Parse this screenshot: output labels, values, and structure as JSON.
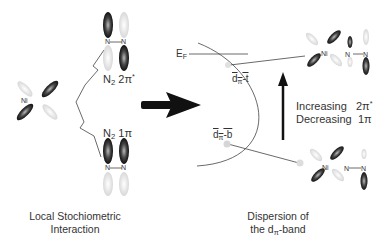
{
  "diagram": {
    "left_ni_complex": {
      "atom_label": "Ni"
    },
    "n2_antibonding": {
      "atom_left": "N",
      "atom_right": "N",
      "label_main": "N",
      "label_sub": "2",
      "label_orbital": "2π",
      "label_sup": "*"
    },
    "n2_bonding": {
      "atom_left": "N",
      "atom_right": "N",
      "label_main": "N",
      "label_sub": "2",
      "label_orbital": "1π"
    },
    "band": {
      "fermi_label": "E",
      "fermi_sub": "F",
      "top_label": "d",
      "top_sub": "π",
      "top_suffix": "-t",
      "bottom_label": "d",
      "bottom_sub": "π",
      "bottom_suffix": "-b"
    },
    "top_right_complex": {
      "ni": "Ni",
      "n_left": "N",
      "n_right": "N"
    },
    "bottom_right_complex": {
      "ni": "Ni",
      "n_left": "N",
      "n_right": "N"
    },
    "trend": {
      "row1_word": "Increasing",
      "row1_orbital": "2π",
      "row1_sup": "*",
      "row2_word": "Decreasing",
      "row2_orbital": "1π"
    },
    "captions": {
      "left_line1": "Local Stochiometric",
      "left_line2": "Interaction",
      "right_line1": "Dispersion of",
      "right_line2_pre": "the d",
      "right_line2_sub": "π",
      "right_line2_post": "-band"
    },
    "colors": {
      "orbital_dark": "#222222",
      "orbital_light": "#dddddd",
      "line": "#444444",
      "arrow": "#111111"
    }
  }
}
